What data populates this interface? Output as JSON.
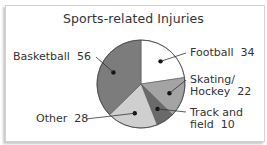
{
  "chart_data": {
    "type": "pie",
    "title": "Sports-related Injuries",
    "categories": [
      "Football",
      "Skating/Hockey",
      "Track and field",
      "Other",
      "Basketball"
    ],
    "values": [
      34,
      22,
      10,
      28,
      56
    ],
    "colors": [
      "#ffffff",
      "#a4a4a4",
      "#6a6a6a",
      "#cfcfcf",
      "#7c7c7c"
    ],
    "labels": [
      {
        "line1": "Football",
        "value": "34"
      },
      {
        "line1": "Skating/",
        "line2": "Hockey",
        "value": "22"
      },
      {
        "line1": "Track and",
        "line2": "field",
        "value": "10"
      },
      {
        "line1": "Other",
        "value": "28"
      },
      {
        "line1": "Basketball",
        "value": "56"
      }
    ],
    "legend": "none (leader-line labels)",
    "start_angle": "12 o'clock, clockwise"
  }
}
